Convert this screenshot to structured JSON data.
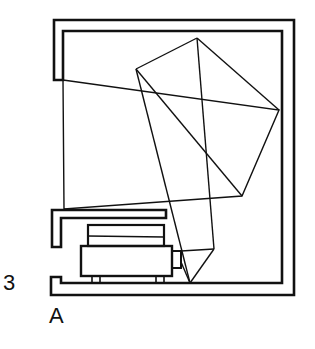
{
  "figure": {
    "labels": {
      "number": "3",
      "letter": "A"
    },
    "colors": {
      "stroke": "#111111",
      "background": "#ffffff"
    },
    "components": {
      "enclosure": "cabinet-frame",
      "projector": "projector-unit",
      "shelf": "upper-shelf",
      "light_path": "reflected-ray-polygon"
    }
  }
}
